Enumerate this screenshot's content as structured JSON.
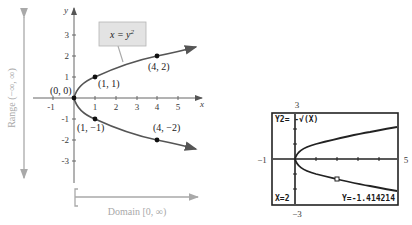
{
  "left_graph": {
    "equation_label": "x = y",
    "equation_exponent": "2",
    "x_axis_label": "x",
    "y_axis_label": "y",
    "x_ticks": [
      "-1",
      "1",
      "2",
      "3",
      "4",
      "5"
    ],
    "y_ticks": [
      "3",
      "2",
      "1",
      "-1",
      "-2",
      "-3"
    ],
    "points": [
      {
        "label": "(0, 0)",
        "x": 0,
        "y": 0
      },
      {
        "label": "(1, 1)",
        "x": 1,
        "y": 1
      },
      {
        "label": "(4, 2)",
        "x": 4,
        "y": 2
      },
      {
        "label": "(1, −1)",
        "x": 1,
        "y": -1
      },
      {
        "label": "(4, −2)",
        "x": 4,
        "y": -2
      }
    ],
    "range_label": "Range (−∞, ∞)",
    "domain_label": "Domain [0, ∞)",
    "curve_color": "#555555",
    "annotation_color": "#a9a9a9",
    "label_box_color": "#e3e3e3"
  },
  "calculator": {
    "function_label": "Y2= -√(X)",
    "cursor_x": "X=2",
    "cursor_y": "Y=-1.414214",
    "window": {
      "ymax": "3",
      "ymin": "−3",
      "xmin": "−1",
      "xmax": "5"
    }
  }
}
